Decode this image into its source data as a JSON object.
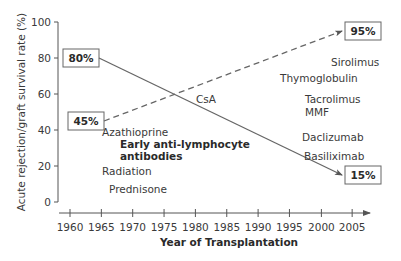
{
  "chart_data": {
    "type": "line",
    "title": "",
    "xlabel": "Year of Transplantation",
    "ylabel": "Acute rejection/graft survival rate (%)",
    "xlim": [
      1960,
      2005
    ],
    "ylim": [
      0,
      100
    ],
    "x_ticks": [
      "1960",
      "1965",
      "1970",
      "1975",
      "1980",
      "1985",
      "1990",
      "1995",
      "2000",
      "2005"
    ],
    "y_ticks": [
      "0",
      "20",
      "40",
      "60",
      "80",
      "100"
    ],
    "grid": false,
    "legend": "none",
    "series": [
      {
        "name": "Acute rejection rate",
        "style": "solid",
        "x": [
          1965,
          2004
        ],
        "values": [
          80,
          15
        ],
        "start_label": "80%",
        "end_label": "15%"
      },
      {
        "name": "Graft survival rate",
        "style": "dashed",
        "x": [
          1965,
          2004
        ],
        "values": [
          45,
          95
        ],
        "start_label": "45%",
        "end_label": "95%"
      }
    ],
    "annotations": [
      {
        "text": "Azathioprine",
        "bold": false
      },
      {
        "text": "Early anti-lymphocyte",
        "bold": true
      },
      {
        "text": "antibodies",
        "bold": true
      },
      {
        "text": "Radiation",
        "bold": false
      },
      {
        "text": "Prednisone",
        "bold": false
      },
      {
        "text": "CsA",
        "bold": false
      },
      {
        "text": "Sirolimus",
        "bold": false
      },
      {
        "text": "Thymoglobulin",
        "bold": false
      },
      {
        "text": "Tacrolimus",
        "bold": false
      },
      {
        "text": "MMF",
        "bold": false
      },
      {
        "text": "Daclizumab",
        "bold": false
      },
      {
        "text": "Basiliximab",
        "bold": false
      }
    ]
  }
}
